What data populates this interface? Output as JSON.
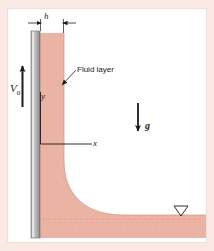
{
  "figure": {
    "panel_bg": "#ffffff",
    "outer_bg": "#fbe9e5"
  },
  "labels": {
    "thickness": "h",
    "plate_velocity": "V",
    "plate_velocity_sub": "0",
    "fluid_layer": "Fluid layer",
    "axis_y": "y",
    "axis_x": "x",
    "gravity": "g"
  },
  "colors": {
    "fluid": "#eab3a4",
    "fluid_dark": "#d99b8a",
    "plate_face": "#b8b8b8",
    "plate_edge": "#8c8c8c",
    "plate_highlight": "#dcdcdc",
    "line": "#1a1a1a",
    "panel_border": "#f3ded9"
  },
  "geometry": {
    "plate_x": 31,
    "plate_width": 9,
    "plate_top": 31,
    "plate_bottom": 238,
    "fluid_left": 40,
    "fluid_right": 64,
    "fluid_top": 33,
    "pool_top": 215,
    "pool_bottom": 238,
    "pool_right": 206,
    "origin_x": 40,
    "origin_y": 144
  },
  "icons": {
    "free_surface": "free-surface-triangle",
    "gravity_arrow": "down-arrow",
    "velocity_arrow": "up-arrow",
    "dimension_arrows": "inward-dimension-arrows",
    "leader": "leader-arrow"
  }
}
